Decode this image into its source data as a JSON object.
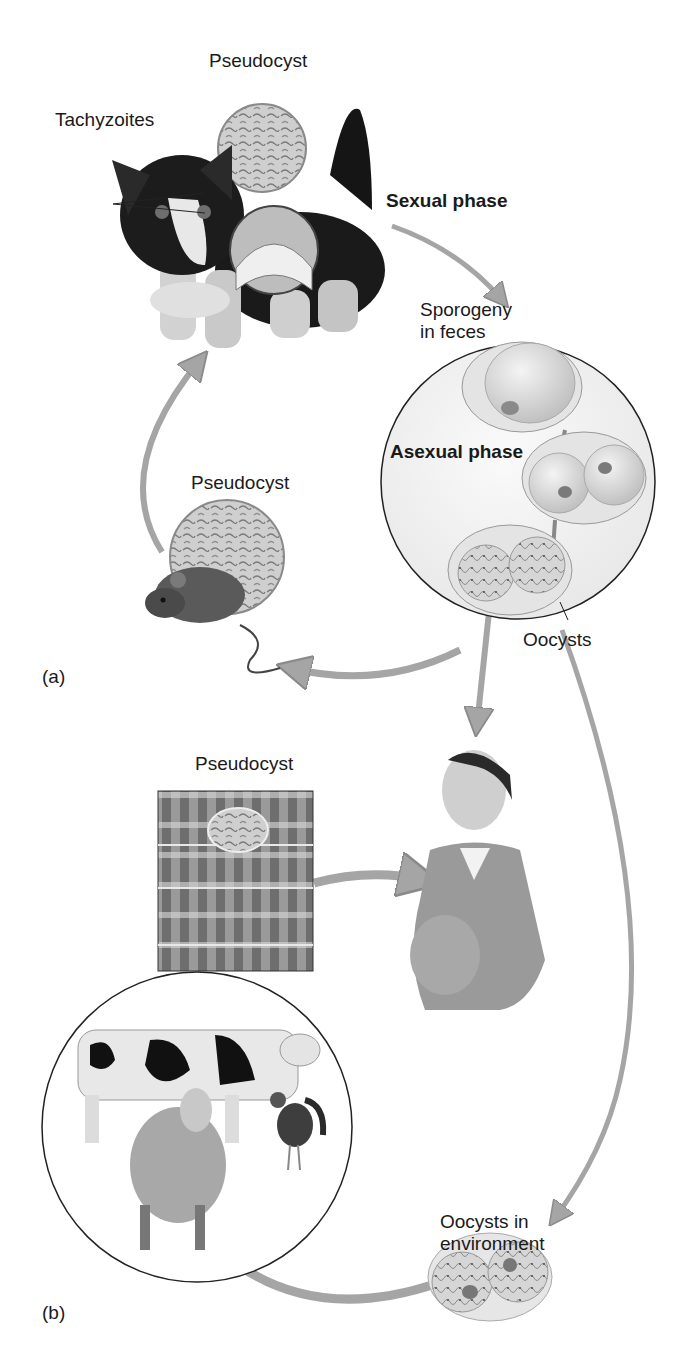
{
  "diagram": {
    "type": "life-cycle",
    "panels": [
      {
        "id": "a",
        "label": "(a)"
      },
      {
        "id": "b",
        "label": "(b)"
      }
    ],
    "labels": {
      "pseudocyst_cat": "Pseudocyst",
      "tachyzoites": "Tachyzoites",
      "sexual_phase": "Sexual phase",
      "sporogeny_line1": "Sporogeny",
      "sporogeny_line2": "in feces",
      "asexual_phase": "Asexual phase",
      "pseudocyst_mouse": "Pseudocyst",
      "oocysts": "Oocysts",
      "pseudocyst_muscle": "Pseudocyst",
      "oocysts_env_line1": "Oocysts in",
      "oocysts_env_line2": "environment",
      "panel_a": "(a)",
      "panel_b": "(b)"
    },
    "nodes": [
      {
        "id": "cat",
        "name": "Cat (definitive host)"
      },
      {
        "id": "sporogeny",
        "name": "Sporogeny in feces"
      },
      {
        "id": "mouse",
        "name": "Mouse with pseudocyst"
      },
      {
        "id": "woman",
        "name": "Pregnant woman"
      },
      {
        "id": "muscle",
        "name": "Muscle tissue pseudocyst"
      },
      {
        "id": "livestock",
        "name": "Cow, sheep, chicken"
      },
      {
        "id": "env_oocysts",
        "name": "Oocysts in environment"
      }
    ],
    "edges": [
      {
        "from": "cat",
        "to": "sporogeny",
        "label": "Sexual phase"
      },
      {
        "from": "sporogeny",
        "to": "mouse"
      },
      {
        "from": "mouse",
        "to": "cat"
      },
      {
        "from": "sporogeny",
        "to": "woman",
        "label": "Oocysts"
      },
      {
        "from": "sporogeny",
        "to": "env_oocysts",
        "label": "Oocysts"
      },
      {
        "from": "muscle",
        "to": "woman"
      },
      {
        "from": "env_oocysts",
        "to": "livestock"
      }
    ],
    "colors": {
      "arrow": "#a7a7a7",
      "arrow_edge": "#8a8a8a",
      "circle_line": "#222222",
      "cell_fill": "#dcdcdc"
    }
  }
}
